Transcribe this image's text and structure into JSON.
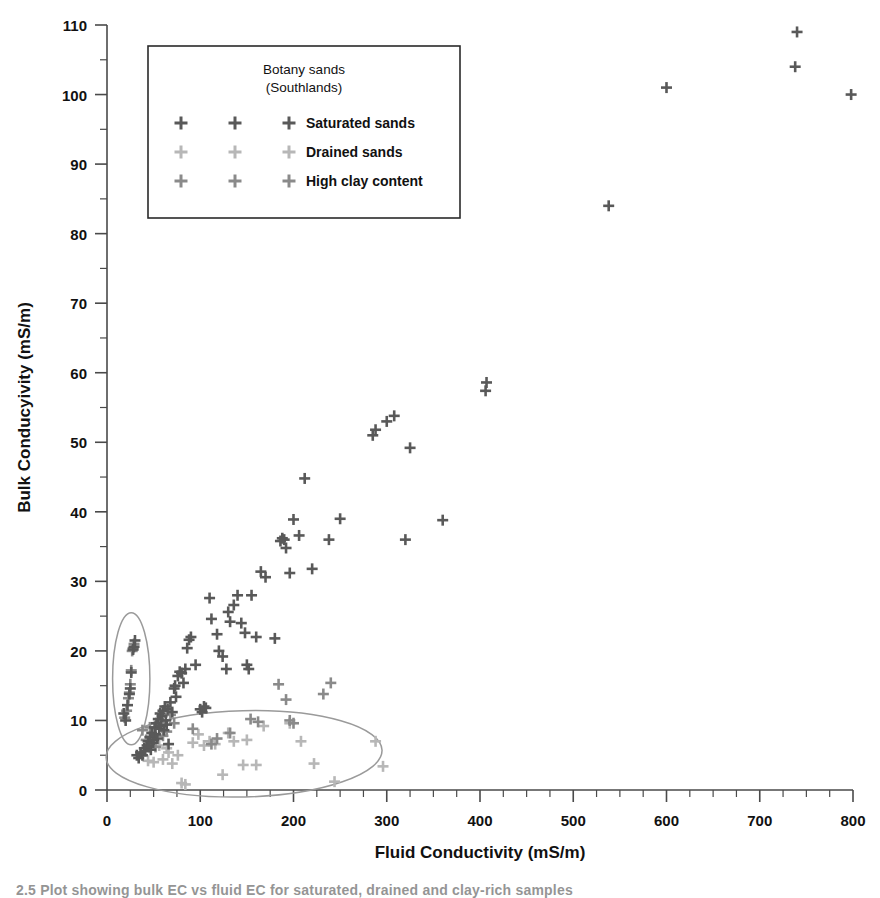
{
  "figure": {
    "caption": "2.5  Plot showing bulk EC vs fluid EC for saturated, drained and clay-rich samples"
  },
  "legend": {
    "title_line1": "Botany sands",
    "title_line2": "(Southlands)",
    "entries": [
      {
        "label": "Saturated sands",
        "color": "#595959",
        "key": "saturated"
      },
      {
        "label": "Drained sands",
        "color": "#b7b7b7",
        "key": "drained"
      },
      {
        "label": "High clay content",
        "color": "#8a8a8a",
        "key": "clay"
      }
    ]
  },
  "chart_data": {
    "type": "scatter",
    "title": "",
    "xlabel": "Fluid Conductivity (mS/m)",
    "ylabel": "Bulk Conducyivity (mS/m)",
    "xlim": [
      0,
      800
    ],
    "ylim": [
      0,
      110
    ],
    "xticks": [
      0,
      100,
      200,
      300,
      400,
      500,
      600,
      700,
      800
    ],
    "yticks": [
      0,
      10,
      20,
      30,
      40,
      50,
      60,
      70,
      80,
      90,
      100,
      110
    ],
    "x_minor_step": 25,
    "y_minor_step": 5,
    "grid": false,
    "legend_position": "upper-left-inside",
    "series": [
      {
        "name": "Saturated sands",
        "color": "#595959",
        "points": [
          [
            18,
            11.0
          ],
          [
            20,
            10.0
          ],
          [
            22,
            12.2
          ],
          [
            24,
            13.8
          ],
          [
            25,
            14.6
          ],
          [
            26,
            16.9
          ],
          [
            28,
            20.2
          ],
          [
            29,
            20.6
          ],
          [
            30,
            21.5
          ],
          [
            32,
            5.0
          ],
          [
            34,
            4.6
          ],
          [
            36,
            5.4
          ],
          [
            38,
            5.0
          ],
          [
            40,
            6.0
          ],
          [
            41,
            5.6
          ],
          [
            43,
            6.4
          ],
          [
            44,
            7.0
          ],
          [
            45,
            6.2
          ],
          [
            46,
            7.6
          ],
          [
            47,
            5.8
          ],
          [
            48,
            8.2
          ],
          [
            49,
            6.8
          ],
          [
            50,
            7.2
          ],
          [
            51,
            9.0
          ],
          [
            52,
            8.0
          ],
          [
            53,
            9.6
          ],
          [
            54,
            7.4
          ],
          [
            55,
            10.2
          ],
          [
            56,
            8.8
          ],
          [
            57,
            11.0
          ],
          [
            58,
            9.2
          ],
          [
            59,
            10.6
          ],
          [
            60,
            11.4
          ],
          [
            61,
            8.6
          ],
          [
            62,
            12.0
          ],
          [
            63,
            10.0
          ],
          [
            64,
            9.4
          ],
          [
            65,
            11.6
          ],
          [
            66,
            6.6
          ],
          [
            68,
            12.6
          ],
          [
            70,
            11.2
          ],
          [
            72,
            14.6
          ],
          [
            73,
            15.0
          ],
          [
            74,
            13.4
          ],
          [
            76,
            16.4
          ],
          [
            78,
            17.0
          ],
          [
            80,
            16.8
          ],
          [
            82,
            15.4
          ],
          [
            84,
            17.4
          ],
          [
            86,
            20.4
          ],
          [
            88,
            21.6
          ],
          [
            90,
            22.0
          ],
          [
            95,
            18.0
          ],
          [
            100,
            11.6
          ],
          [
            102,
            11.2
          ],
          [
            104,
            12.0
          ],
          [
            106,
            11.8
          ],
          [
            110,
            27.6
          ],
          [
            112,
            24.6
          ],
          [
            118,
            22.4
          ],
          [
            120,
            20.0
          ],
          [
            124,
            19.2
          ],
          [
            128,
            17.4
          ],
          [
            130,
            25.6
          ],
          [
            132,
            24.2
          ],
          [
            136,
            26.6
          ],
          [
            140,
            28.0
          ],
          [
            144,
            24.0
          ],
          [
            148,
            22.6
          ],
          [
            150,
            18.0
          ],
          [
            152,
            17.4
          ],
          [
            155,
            28.0
          ],
          [
            160,
            22.0
          ],
          [
            165,
            31.4
          ],
          [
            170,
            30.6
          ],
          [
            180,
            21.8
          ],
          [
            186,
            35.8
          ],
          [
            188,
            36.2
          ],
          [
            190,
            36.0
          ],
          [
            192,
            34.8
          ],
          [
            196,
            31.2
          ],
          [
            200,
            38.9
          ],
          [
            206,
            36.6
          ],
          [
            212,
            44.8
          ],
          [
            220,
            31.8
          ],
          [
            238,
            36.0
          ],
          [
            250,
            39.0
          ],
          [
            285,
            51.0
          ],
          [
            288,
            51.8
          ],
          [
            300,
            53.0
          ],
          [
            308,
            53.8
          ],
          [
            320,
            36.0
          ],
          [
            325,
            49.2
          ],
          [
            360,
            38.8
          ],
          [
            406,
            57.4
          ],
          [
            407,
            58.6
          ],
          [
            538,
            84.0
          ],
          [
            600,
            101.0
          ],
          [
            738,
            104.0
          ],
          [
            740,
            109.0
          ],
          [
            798,
            100.0
          ]
        ]
      },
      {
        "name": "Drained sands",
        "color": "#b7b7b7",
        "points": [
          [
            44,
            4.2
          ],
          [
            50,
            4.0
          ],
          [
            56,
            6.4
          ],
          [
            60,
            4.4
          ],
          [
            64,
            6.0
          ],
          [
            66,
            5.4
          ],
          [
            70,
            3.8
          ],
          [
            76,
            5.0
          ],
          [
            80,
            1.0
          ],
          [
            84,
            0.8
          ],
          [
            92,
            6.8
          ],
          [
            98,
            8.0
          ],
          [
            104,
            6.4
          ],
          [
            110,
            7.0
          ],
          [
            116,
            6.6
          ],
          [
            124,
            2.2
          ],
          [
            130,
            8.2
          ],
          [
            136,
            7.0
          ],
          [
            146,
            3.6
          ],
          [
            150,
            7.2
          ],
          [
            160,
            3.6
          ],
          [
            168,
            9.2
          ],
          [
            196,
            9.6
          ],
          [
            208,
            7.0
          ],
          [
            222,
            3.8
          ],
          [
            244,
            1.2
          ],
          [
            288,
            7.0
          ],
          [
            296,
            3.4
          ]
        ]
      },
      {
        "name": "High clay content",
        "color": "#8a8a8a",
        "points": [
          [
            19,
            10.4
          ],
          [
            21,
            11.4
          ],
          [
            23,
            13.2
          ],
          [
            24,
            14.0
          ],
          [
            25,
            15.2
          ],
          [
            26,
            17.2
          ],
          [
            27,
            20.0
          ],
          [
            28,
            20.4
          ],
          [
            29,
            21.0
          ],
          [
            38,
            8.6
          ],
          [
            42,
            7.2
          ],
          [
            46,
            9.0
          ],
          [
            52,
            6.2
          ],
          [
            56,
            9.8
          ],
          [
            60,
            7.8
          ],
          [
            64,
            8.4
          ],
          [
            68,
            10.8
          ],
          [
            72,
            9.6
          ],
          [
            92,
            8.8
          ],
          [
            112,
            6.6
          ],
          [
            118,
            7.4
          ],
          [
            132,
            8.2
          ],
          [
            154,
            10.2
          ],
          [
            162,
            9.8
          ],
          [
            184,
            15.2
          ],
          [
            192,
            13.0
          ],
          [
            196,
            10.0
          ],
          [
            200,
            9.6
          ],
          [
            232,
            13.8
          ],
          [
            240,
            15.4
          ]
        ]
      }
    ],
    "annotations": [
      {
        "type": "ellipse",
        "name": "clay-cluster-ellipse",
        "cx": 26,
        "cy": 16.0,
        "rx": 20,
        "ry": 9.5,
        "rotation": 0
      },
      {
        "type": "ellipse",
        "name": "drained-cluster-ellipse",
        "cx": 147,
        "cy": 5.2,
        "rx": 148,
        "ry": 6.2,
        "rotation": -1.5
      }
    ]
  }
}
